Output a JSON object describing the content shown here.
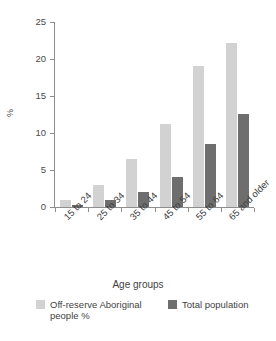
{
  "chart_data": {
    "type": "bar",
    "title": "",
    "subtitle": "",
    "xlabel": "Age groups",
    "ylabel": "%",
    "categories": [
      "15 to 24",
      "25 to 34",
      "35 to 44",
      "45 to 54",
      "55 to 64",
      "65 and older"
    ],
    "series": [
      {
        "name": "Off-reserve Aboriginal people %",
        "color": "#d2d2d2",
        "values": [
          0.9,
          3.0,
          6.5,
          11.2,
          19.0,
          22.2
        ]
      },
      {
        "name": "Total population",
        "color": "#6e6e6e",
        "values": [
          0.3,
          1.0,
          2.0,
          4.1,
          8.5,
          12.6
        ]
      }
    ],
    "ylim": [
      0,
      25
    ],
    "yticks": [
      0,
      5,
      10,
      15,
      20,
      25
    ],
    "ytick_labels": [
      "0",
      "5",
      "10",
      "15",
      "20",
      "25"
    ],
    "grid": false,
    "legend_position": "bottom",
    "xtick_label_rotation": -45
  },
  "axes": {
    "y_title": "%",
    "x_title": "Age groups"
  },
  "legend": {
    "entries": [
      {
        "label": "Off-reserve Aboriginal people %",
        "color": "#d2d2d2"
      },
      {
        "label": "Total population",
        "color": "#6e6e6e"
      }
    ]
  },
  "colors": {
    "series_light": "#d2d2d2",
    "series_dark": "#6e6e6e",
    "axis": "#8d8d8d",
    "text": "#3f3f3f",
    "background": "#ffffff"
  }
}
